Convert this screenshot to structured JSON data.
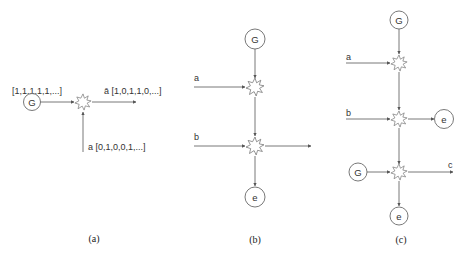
{
  "diagram": {
    "panels": [
      {
        "id": "a",
        "caption": "(a)",
        "generator_label": "G",
        "generator_sequence": "[1,1,1,1,1,...]",
        "output_label": "ā",
        "output_sequence": "[1,0,1,1,0,...]",
        "input_label": "a",
        "input_sequence": "[0,1,0,0,1,...]"
      },
      {
        "id": "b",
        "caption": "(b)",
        "generator_label": "G",
        "input_1_label": "a",
        "input_2_label": "b",
        "sink_label": "e"
      },
      {
        "id": "c",
        "caption": "(c)",
        "generator_top_label": "G",
        "generator_left_label": "G",
        "input_1_label": "a",
        "input_2_label": "b",
        "sink_right_label": "e",
        "sink_bottom_label": "e",
        "output_label": "c"
      }
    ],
    "colors": {
      "line": "#6a6a6a",
      "text": "#333333",
      "background": "#ffffff"
    }
  }
}
